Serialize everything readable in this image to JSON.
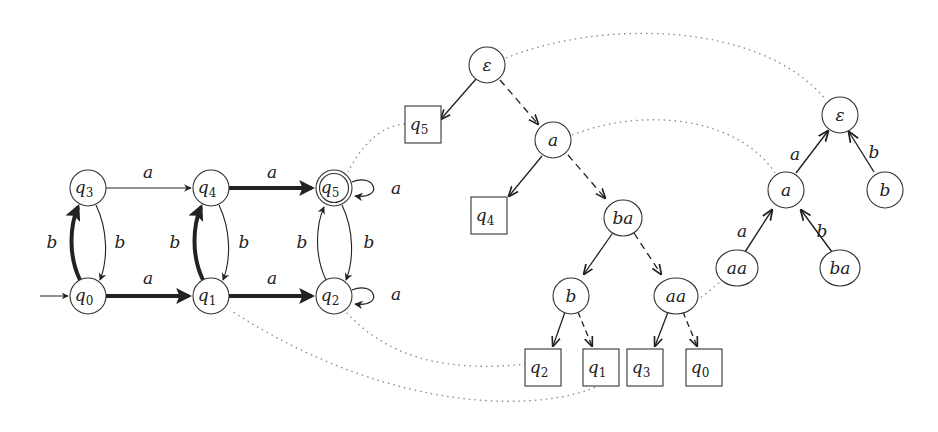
{
  "dfa": {
    "states": [
      {
        "id": "q0",
        "label": "q",
        "sub": "0",
        "x": 88,
        "y": 296,
        "initial": true,
        "accepting": false
      },
      {
        "id": "q1",
        "label": "q",
        "sub": "1",
        "x": 211,
        "y": 296,
        "initial": false,
        "accepting": false
      },
      {
        "id": "q2",
        "label": "q",
        "sub": "2",
        "x": 334,
        "y": 296,
        "initial": false,
        "accepting": false
      },
      {
        "id": "q3",
        "label": "q",
        "sub": "3",
        "x": 88,
        "y": 188,
        "initial": false,
        "accepting": false
      },
      {
        "id": "q4",
        "label": "q",
        "sub": "4",
        "x": 211,
        "y": 188,
        "initial": false,
        "accepting": false
      },
      {
        "id": "q5",
        "label": "q",
        "sub": "5",
        "x": 334,
        "y": 188,
        "initial": false,
        "accepting": true
      }
    ],
    "transitions": [
      {
        "from": "q3",
        "to": "q4",
        "symbol": "a",
        "bold": false
      },
      {
        "from": "q4",
        "to": "q5",
        "symbol": "a",
        "bold": true
      },
      {
        "from": "q5",
        "to": "q5",
        "symbol": "a",
        "bold": false
      },
      {
        "from": "q0",
        "to": "q1",
        "symbol": "a",
        "bold": true
      },
      {
        "from": "q1",
        "to": "q2",
        "symbol": "a",
        "bold": true
      },
      {
        "from": "q2",
        "to": "q2",
        "symbol": "a",
        "bold": false
      },
      {
        "from": "q0",
        "to": "q3",
        "symbol": "b",
        "bold": true
      },
      {
        "from": "q3",
        "to": "q0",
        "symbol": "b",
        "bold": false
      },
      {
        "from": "q1",
        "to": "q4",
        "symbol": "b",
        "bold": true
      },
      {
        "from": "q4",
        "to": "q1",
        "symbol": "b",
        "bold": false
      },
      {
        "from": "q2",
        "to": "q5",
        "symbol": "b",
        "bold": false
      },
      {
        "from": "q5",
        "to": "q2",
        "symbol": "b",
        "bold": false
      }
    ],
    "labels": {
      "q3q4": "a",
      "q4q5": "a",
      "q5loop": "a",
      "q0q1": "a",
      "q1q2": "a",
      "q2loop": "a",
      "q0q3": "b",
      "q3q0": "b",
      "q1q4": "b",
      "q4q1": "b",
      "q2q5": "b",
      "q5q2": "b"
    }
  },
  "classification_tree": {
    "inner_nodes": {
      "eps": "ε",
      "a": "a",
      "ba": "ba",
      "b": "b",
      "aa": "aa"
    },
    "leaves": {
      "q5": {
        "label": "q",
        "sub": "5"
      },
      "q4": {
        "label": "q",
        "sub": "4"
      },
      "q2": {
        "label": "q",
        "sub": "2"
      },
      "q1": {
        "label": "q",
        "sub": "1"
      },
      "q3": {
        "label": "q",
        "sub": "3"
      },
      "q0": {
        "label": "q",
        "sub": "0"
      }
    }
  },
  "prefix_tree": {
    "nodes": {
      "eps": "ε",
      "a": "a",
      "b": "b",
      "aa": "aa",
      "ba": "ba"
    },
    "edge_labels": {
      "a_eps": "a",
      "b_eps": "b",
      "aa_a": "a",
      "ba_a": "b"
    }
  }
}
